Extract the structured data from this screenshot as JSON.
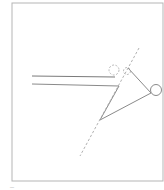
{
  "figure": {
    "type": "line-diagram",
    "colors": {
      "stroke": "#8a8a8a",
      "frame": "#b5b5b5",
      "dashed": "#a8a8a8",
      "background": "#ffffff"
    },
    "frame": {
      "x": 12,
      "y": 3,
      "w": 151,
      "h": 178
    },
    "parallel_lines": [
      {
        "x1": 32,
        "y1": 76,
        "x2": 115,
        "y2": 77
      },
      {
        "x1": 32,
        "y1": 84,
        "x2": 119,
        "y2": 86
      }
    ],
    "arrow_polyline": "119,86 100,120 151,93 128,68",
    "tip_circle": {
      "cx": 156,
      "cy": 90,
      "r": 5.5
    },
    "dashed_circles": [
      {
        "cx": 114,
        "cy": 70,
        "r": 5
      },
      {
        "cx": 127,
        "cy": 71,
        "r": 3.5
      }
    ],
    "dashed_line": {
      "x1": 139,
      "y1": 48,
      "x2": 80,
      "y2": 156
    },
    "caption_mark": "—"
  }
}
